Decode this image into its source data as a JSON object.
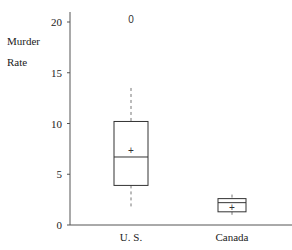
{
  "chart_data": {
    "type": "box",
    "title": "",
    "xlabel": "",
    "ylabel": "Murder Rate",
    "ylabel_lines": [
      "Murder",
      "Rate"
    ],
    "ylim": [
      0,
      21
    ],
    "yticks": [
      0,
      5,
      10,
      15,
      20
    ],
    "grid": false,
    "legend": null,
    "categories": [
      "U. S.",
      "Canada"
    ],
    "series": [
      {
        "name": "U. S.",
        "whisker_low": 1.7,
        "q1": 3.9,
        "median": 6.7,
        "mean": 7.3,
        "q3": 10.2,
        "whisker_high": 13.5,
        "outliers": [
          20.3
        ]
      },
      {
        "name": "Canada",
        "whisker_low": 0.9,
        "q1": 1.3,
        "median": 2.2,
        "mean": 1.7,
        "q3": 2.6,
        "whisker_high": 3.0,
        "outliers": []
      }
    ],
    "mean_marker": "+",
    "outlier_marker": "0"
  },
  "colors": {
    "axis": "#555555",
    "box": "#333333",
    "whisker": "#777777",
    "text": "#222222"
  }
}
